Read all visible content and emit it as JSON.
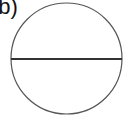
{
  "figure": {
    "label": "(b)",
    "shape": "circle-with-diameter",
    "circle": {
      "cx": 66.5,
      "cy": 58.5,
      "r": 55.5,
      "stroke": "#555555",
      "stroke_width": 1.2
    },
    "diameter": {
      "x1": 11,
      "y1": 59,
      "x2": 122,
      "y2": 59,
      "stroke": "#333333",
      "stroke_width": 2.2
    }
  }
}
